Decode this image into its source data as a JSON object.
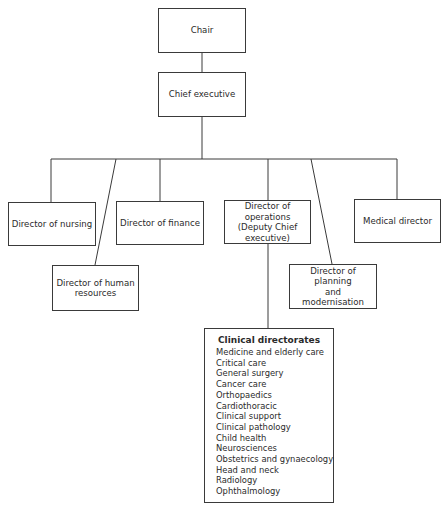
{
  "diagram": {
    "type": "organisational-chart",
    "nodes": {
      "chair": "Chair",
      "chief_executive": "Chief executive",
      "director_nursing": "Director of nursing",
      "director_hr_line1": "Director of human",
      "director_hr_line2": "resources",
      "director_finance": "Director of finance",
      "director_operations_line1": "Director of operations",
      "director_operations_line2": "(Deputy Chief",
      "director_operations_line3": "executive)",
      "director_planning_line1": "Director of planning",
      "director_planning_line2": "and",
      "director_planning_line3": "modernisation",
      "medical_director": "Medical director"
    },
    "clinical_directorates": {
      "title": "Clinical directorates",
      "items": [
        "Medicine and elderly care",
        "Critical care",
        "General surgery",
        "Cancer care",
        "Orthopaedics",
        "Cardiothoracic",
        "Clinical support",
        "Clinical pathology",
        "Child health",
        "Neurosciences",
        "Obstetrics and gynaecology",
        "Head and neck",
        "Radiology",
        "Ophthalmology"
      ]
    },
    "edges": [
      [
        "Chair",
        "Chief executive"
      ],
      [
        "Chief executive",
        "Director of nursing"
      ],
      [
        "Chief executive",
        "Director of human resources"
      ],
      [
        "Chief executive",
        "Director of finance"
      ],
      [
        "Chief executive",
        "Director of operations (Deputy Chief executive)"
      ],
      [
        "Chief executive",
        "Director of planning and modernisation"
      ],
      [
        "Chief executive",
        "Medical director"
      ],
      [
        "Director of operations (Deputy Chief executive)",
        "Clinical directorates"
      ]
    ],
    "colors": {
      "line": "#3a3a3a",
      "text": "#2a2a2a",
      "background": "#ffffff"
    }
  }
}
